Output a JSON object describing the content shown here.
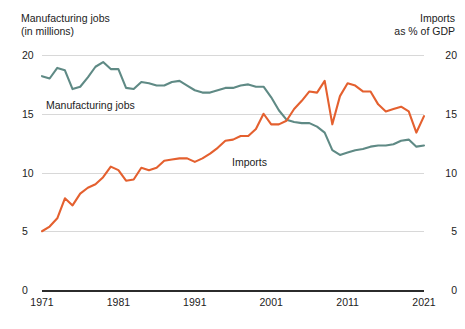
{
  "header": {
    "left_title": "Manufacturing jobs",
    "left_subtitle": "(in millions)",
    "right_title": "Imports",
    "right_subtitle": "as % of GDP"
  },
  "inline_labels": {
    "jobs": "Manufacturing jobs",
    "imports": "Imports"
  },
  "colors": {
    "manufacturing_jobs": "#5f8a85",
    "imports": "#e4602f",
    "gridline": "#d8d8d8",
    "baseline": "#2b2b2b",
    "text": "#222222",
    "background": "#ffffff"
  },
  "axis": {
    "left_ticks": [
      "20",
      "15",
      "10",
      "5",
      "0"
    ],
    "right_ticks": [
      "20",
      "15",
      "10",
      "5",
      "0"
    ],
    "x_ticks": [
      "1971",
      "1981",
      "1991",
      "2001",
      "2011",
      "2021"
    ]
  },
  "chart_data": {
    "type": "line",
    "title": "",
    "xlabel": "",
    "ylabel": "Manufacturing jobs (in millions)",
    "y2label": "Imports as % of GDP",
    "xlim": [
      1971,
      2021
    ],
    "ylim": [
      0,
      20
    ],
    "y2lim": [
      0,
      20
    ],
    "grid": true,
    "legend": "inline",
    "x": [
      1971,
      1972,
      1973,
      1974,
      1975,
      1976,
      1977,
      1978,
      1979,
      1980,
      1981,
      1982,
      1983,
      1984,
      1985,
      1986,
      1987,
      1988,
      1989,
      1990,
      1991,
      1992,
      1993,
      1994,
      1995,
      1996,
      1997,
      1998,
      1999,
      2000,
      2001,
      2002,
      2003,
      2004,
      2005,
      2006,
      2007,
      2008,
      2009,
      2010,
      2011,
      2012,
      2013,
      2014,
      2015,
      2016,
      2017,
      2018,
      2019,
      2020,
      2021
    ],
    "series": [
      {
        "name": "Manufacturing jobs",
        "unit": "millions",
        "axis": "left",
        "color": "#5f8a85",
        "values": [
          18.2,
          18.0,
          18.9,
          18.7,
          17.1,
          17.3,
          18.1,
          19.0,
          19.4,
          18.8,
          18.8,
          17.2,
          17.1,
          17.7,
          17.6,
          17.4,
          17.4,
          17.7,
          17.8,
          17.4,
          17.0,
          16.8,
          16.8,
          17.0,
          17.2,
          17.2,
          17.4,
          17.5,
          17.3,
          17.3,
          16.4,
          15.3,
          14.5,
          14.3,
          14.2,
          14.2,
          13.9,
          13.4,
          11.9,
          11.5,
          11.7,
          11.9,
          12.0,
          12.2,
          12.3,
          12.3,
          12.4,
          12.7,
          12.8,
          12.2,
          12.3
        ]
      },
      {
        "name": "Imports",
        "unit": "% of GDP",
        "axis": "right",
        "color": "#e4602f",
        "values": [
          5.0,
          5.4,
          6.1,
          7.8,
          7.2,
          8.2,
          8.7,
          9.0,
          9.6,
          10.5,
          10.2,
          9.3,
          9.4,
          10.4,
          10.2,
          10.4,
          11.0,
          11.1,
          11.2,
          11.2,
          10.9,
          11.2,
          11.6,
          12.1,
          12.7,
          12.8,
          13.1,
          13.1,
          13.7,
          15.0,
          14.1,
          14.1,
          14.4,
          15.4,
          16.1,
          16.9,
          16.8,
          17.8,
          14.1,
          16.5,
          17.6,
          17.4,
          16.9,
          16.9,
          15.8,
          15.2,
          15.4,
          15.6,
          15.2,
          13.4,
          14.8
        ]
      }
    ]
  }
}
